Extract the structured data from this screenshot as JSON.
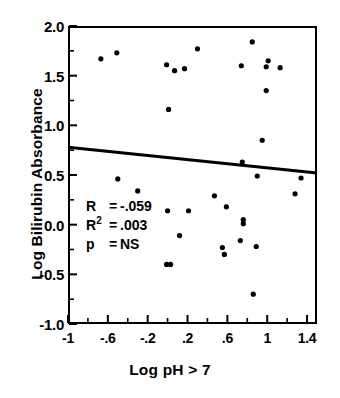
{
  "chart_data": {
    "type": "scatter",
    "title": "",
    "xlabel": "Log pH > 7",
    "ylabel": "Log Bilirubin Absorbance",
    "xlim": [
      -1.0,
      1.5
    ],
    "ylim": [
      -1.0,
      2.0
    ],
    "grid": false,
    "legend": "none",
    "xticks": [
      -1,
      -0.6,
      -0.2,
      0.2,
      0.6,
      1,
      1.4
    ],
    "xtick_labels": [
      "-1",
      "-.6",
      "-.2",
      ".2",
      ".6",
      "1",
      "1.4"
    ],
    "xminor_step": 0.2,
    "yticks": [
      -1.0,
      -0.5,
      0.0,
      0.5,
      1.0,
      1.5,
      2.0
    ],
    "ytick_labels": [
      "-1.0",
      "-0.5",
      "0.0",
      "0.5",
      "1.0",
      "1.5",
      "2.0"
    ],
    "yminor_step": 0.25,
    "marker": "filled-circle",
    "marker_color": "#000000",
    "marker_size_px": 5.2,
    "points": [
      {
        "x": -0.67,
        "y": 1.67
      },
      {
        "x": -0.51,
        "y": 1.73
      },
      {
        "x": -0.5,
        "y": 0.46
      },
      {
        "x": -0.3,
        "y": 0.34
      },
      {
        "x": -0.01,
        "y": 1.61
      },
      {
        "x": 0.01,
        "y": 1.16
      },
      {
        "x": 0.07,
        "y": 1.55
      },
      {
        "x": 0.17,
        "y": 1.57
      },
      {
        "x": 0.0,
        "y": 0.14
      },
      {
        "x": -0.01,
        "y": -0.4
      },
      {
        "x": 0.03,
        "y": -0.4
      },
      {
        "x": 0.12,
        "y": -0.11
      },
      {
        "x": 0.21,
        "y": 0.14
      },
      {
        "x": 0.3,
        "y": 1.77
      },
      {
        "x": 0.47,
        "y": 0.29
      },
      {
        "x": 0.55,
        "y": -0.23
      },
      {
        "x": 0.57,
        "y": -0.3
      },
      {
        "x": 0.59,
        "y": 0.18
      },
      {
        "x": 0.73,
        "y": -0.16
      },
      {
        "x": 0.74,
        "y": 1.6
      },
      {
        "x": 0.75,
        "y": 0.63
      },
      {
        "x": 0.76,
        "y": 0.01
      },
      {
        "x": 0.76,
        "y": 0.05
      },
      {
        "x": 0.85,
        "y": 1.84
      },
      {
        "x": 0.86,
        "y": -0.7
      },
      {
        "x": 0.89,
        "y": -0.22
      },
      {
        "x": 0.9,
        "y": 0.49
      },
      {
        "x": 0.95,
        "y": 0.85
      },
      {
        "x": 0.99,
        "y": 1.59
      },
      {
        "x": 0.99,
        "y": 1.35
      },
      {
        "x": 1.01,
        "y": 1.65
      },
      {
        "x": 1.13,
        "y": 1.58
      },
      {
        "x": 1.28,
        "y": 0.31
      },
      {
        "x": 1.34,
        "y": 0.47
      }
    ],
    "regression_line": {
      "x_start": -1.0,
      "y_start": 0.78,
      "x_end": 1.5,
      "y_end": 0.52,
      "slope": -0.104,
      "intercept": 0.676,
      "width_px": 3,
      "color": "#000000"
    },
    "annotations": {
      "r_symbol": "R",
      "r_equals": "=",
      "r_value": "-.059",
      "r2_symbol": "R",
      "r2_superscript": "2",
      "r2_equals": "=",
      "r2_value": ".003",
      "p_symbol": "p",
      "p_equals": "=",
      "p_value": "NS"
    }
  }
}
